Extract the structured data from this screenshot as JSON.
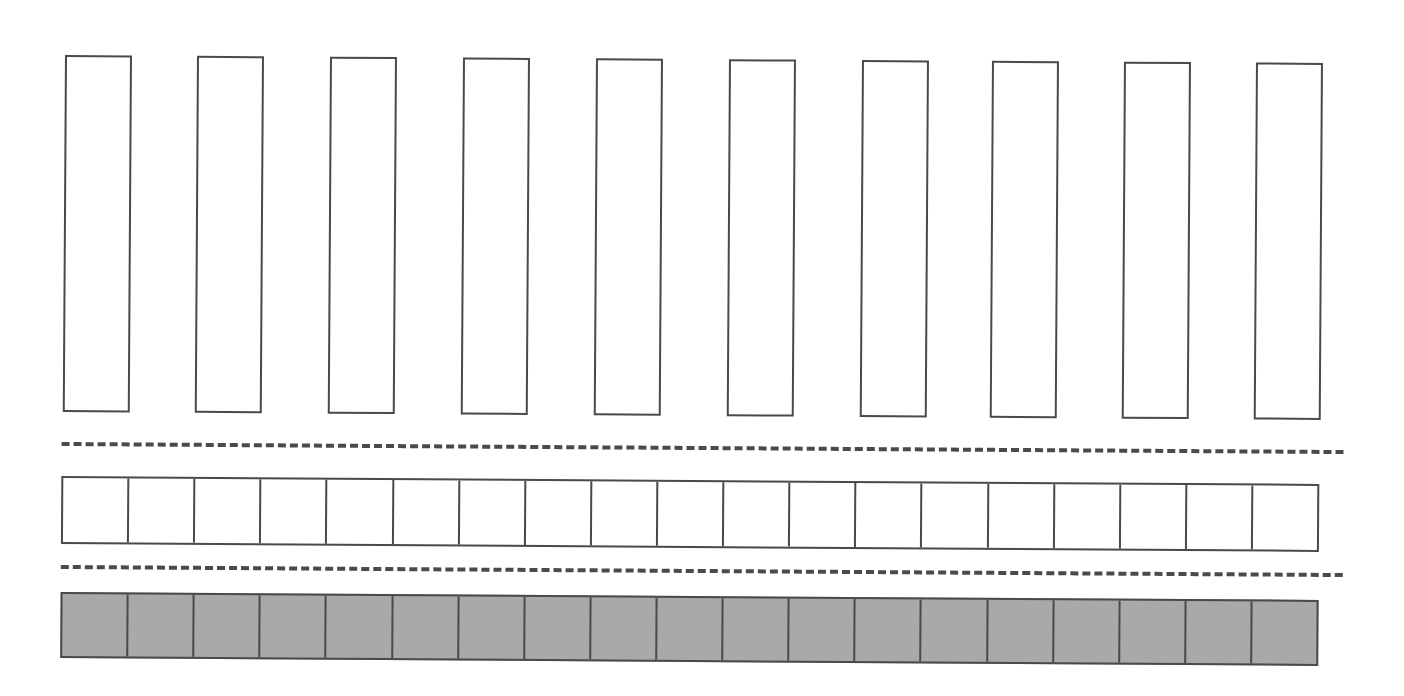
{
  "diagram": {
    "colors": {
      "stroke": "#4a4a4a",
      "background": "#ffffff",
      "empty_fill": "#ffffff",
      "filled_fill": "#a9a9a9"
    },
    "tilt_deg": 0.36,
    "tall_rects": {
      "count": 10,
      "top": 55,
      "height": 357,
      "width": 67,
      "x_positions": [
        65,
        197,
        330,
        463,
        596,
        729,
        862,
        992,
        1124,
        1256
      ]
    },
    "dashed_lines": [
      {
        "top": 442,
        "left": 64,
        "width": 1282
      },
      {
        "top": 565,
        "left": 64,
        "width": 1282
      }
    ],
    "cell_rows": [
      {
        "name": "empty-row",
        "top": 476,
        "left": 64,
        "width": 1258,
        "height": 68,
        "cells": 19,
        "fill": "#ffffff"
      },
      {
        "name": "filled-row",
        "top": 592,
        "left": 64,
        "width": 1258,
        "height": 66,
        "cells": 19,
        "fill": "#a9a9a9"
      }
    ]
  }
}
